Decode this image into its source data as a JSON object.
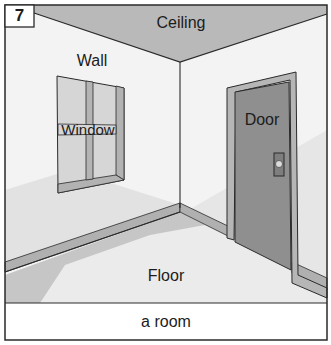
{
  "figure": {
    "number": "7",
    "caption": "a room",
    "labels": {
      "ceiling": "Ceiling",
      "wall": "Wall",
      "window": "Window",
      "door": "Door",
      "floor": "Floor"
    },
    "colors": {
      "ceiling": "#b8b8b8",
      "wall": "#f2f2f2",
      "wall_shadow": "#e0e0e0",
      "floor": "#e6e6e6",
      "floor_shadow": "#c4c4c4",
      "trim": "#b0b0b0",
      "door": "#8e8e8e",
      "door_frame": "#b4b4b4",
      "window_pane": "#d4d4d4",
      "outline": "#2a2a2a"
    }
  }
}
